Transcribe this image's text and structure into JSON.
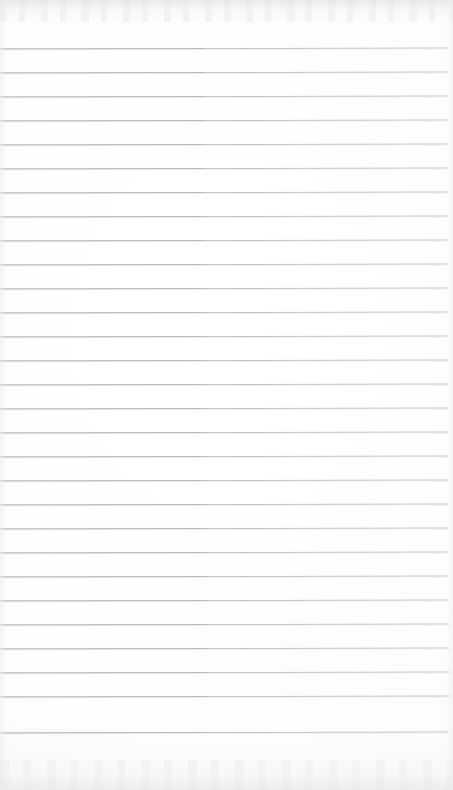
{
  "page": {
    "kind": "blank-lined-notebook-page",
    "width_px": 453,
    "height_px": 790,
    "background_color": "#fdfdfd",
    "has_text_content": false,
    "text_content": "",
    "visible_text_items": []
  },
  "ruling": {
    "line_color": "#b9bdc1",
    "line_color_dark_segment": "#a9aeb3",
    "line_thickness_px": 1,
    "line_spacing_px": 24,
    "first_line_y_px": 48,
    "last_line_y_px": 732,
    "line_count": 29,
    "line_start_x_px": 0,
    "line_end_x_px": 448,
    "top_margin_px": 48,
    "bottom_margin_px": 58,
    "right_margin_px": 5,
    "skew_degrees": -0.12,
    "lines": [
      {
        "index": 1,
        "y_px": 48
      },
      {
        "index": 2,
        "y_px": 72
      },
      {
        "index": 3,
        "y_px": 96
      },
      {
        "index": 4,
        "y_px": 120
      },
      {
        "index": 5,
        "y_px": 144
      },
      {
        "index": 6,
        "y_px": 168
      },
      {
        "index": 7,
        "y_px": 192
      },
      {
        "index": 8,
        "y_px": 216
      },
      {
        "index": 9,
        "y_px": 240
      },
      {
        "index": 10,
        "y_px": 264
      },
      {
        "index": 11,
        "y_px": 288
      },
      {
        "index": 12,
        "y_px": 312
      },
      {
        "index": 13,
        "y_px": 336
      },
      {
        "index": 14,
        "y_px": 360
      },
      {
        "index": 15,
        "y_px": 384
      },
      {
        "index": 16,
        "y_px": 408
      },
      {
        "index": 17,
        "y_px": 432
      },
      {
        "index": 18,
        "y_px": 456
      },
      {
        "index": 19,
        "y_px": 480
      },
      {
        "index": 20,
        "y_px": 504
      },
      {
        "index": 21,
        "y_px": 528
      },
      {
        "index": 22,
        "y_px": 552
      },
      {
        "index": 23,
        "y_px": 576
      },
      {
        "index": 24,
        "y_px": 600
      },
      {
        "index": 25,
        "y_px": 624
      },
      {
        "index": 26,
        "y_px": 648
      },
      {
        "index": 27,
        "y_px": 672
      },
      {
        "index": 28,
        "y_px": 696
      },
      {
        "index": 29,
        "y_px": 732
      }
    ]
  },
  "artifacts": {
    "top_edge_noise": true,
    "bottom_edge_noise": true,
    "side_edge_vignette": true,
    "noise_color": "#e2e3e5"
  }
}
